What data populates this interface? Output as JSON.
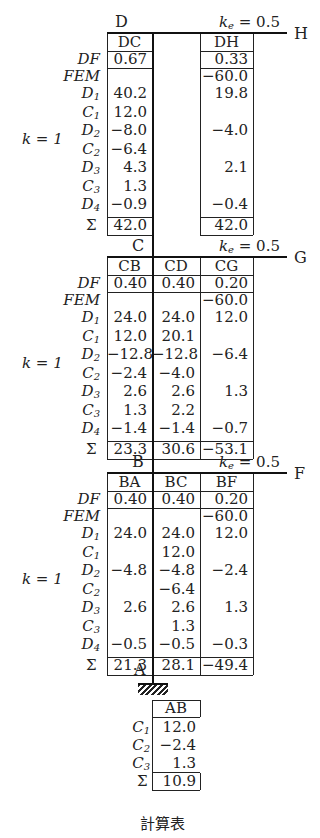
{
  "caption": "計算表",
  "row_labels": {
    "df": "DF",
    "fem": "FEM",
    "d1": "D",
    "d1_sub": "1",
    "c1": "C",
    "c1_sub": "1",
    "d2": "D",
    "d2_sub": "2",
    "c2": "C",
    "c2_sub": "2",
    "d3": "D",
    "d3_sub": "3",
    "c3": "C",
    "c3_sub": "3",
    "d4": "D",
    "d4_sub": "4",
    "sum": "Σ"
  },
  "k_label": "k = 1",
  "ke_label": "ke = 0.5",
  "nodes": {
    "D": "D",
    "H": "H",
    "C": "C",
    "G": "G",
    "B": "B",
    "F": "F",
    "A": "A"
  },
  "sections": [
    {
      "node": "D",
      "beam_end": "H",
      "columns": [
        {
          "header": "DC",
          "DF": "0.67",
          "FEM": "",
          "D1": "40.2",
          "C1": "12.0",
          "D2": "−8.0",
          "C2": "−6.4",
          "D3": "4.3",
          "C3": "1.3",
          "D4": "−0.9",
          "sum": "42.0"
        },
        {
          "header": "DH",
          "DF": "0.33",
          "FEM": "−60.0",
          "D1": "19.8",
          "C1": "",
          "D2": "−4.0",
          "C2": "",
          "D3": "2.1",
          "C3": "",
          "D4": "−0.4",
          "sum": "42.0"
        }
      ]
    },
    {
      "node": "C",
      "beam_end": "G",
      "columns": [
        {
          "header": "CB",
          "DF": "0.40",
          "FEM": "",
          "D1": "24.0",
          "C1": "12.0",
          "D2": "−12.8",
          "C2": "−2.4",
          "D3": "2.6",
          "C3": "1.3",
          "D4": "−1.4",
          "sum": "23.3"
        },
        {
          "header": "CD",
          "DF": "0.40",
          "FEM": "",
          "D1": "24.0",
          "C1": "20.1",
          "D2": "−12.8",
          "C2": "−4.0",
          "D3": "2.6",
          "C3": "2.2",
          "D4": "−1.4",
          "sum": "30.6"
        },
        {
          "header": "CG",
          "DF": "0.20",
          "FEM": "−60.0",
          "D1": "12.0",
          "C1": "",
          "D2": "−6.4",
          "C2": "",
          "D3": "1.3",
          "C3": "",
          "D4": "−0.7",
          "sum": "−53.1"
        }
      ]
    },
    {
      "node": "B",
      "beam_end": "F",
      "columns": [
        {
          "header": "BA",
          "DF": "0.40",
          "FEM": "",
          "D1": "24.0",
          "C1": "",
          "D2": "−4.8",
          "C2": "",
          "D3": "2.6",
          "C3": "",
          "D4": "−0.5",
          "sum": "21.3"
        },
        {
          "header": "BC",
          "DF": "0.40",
          "FEM": "",
          "D1": "24.0",
          "C1": "12.0",
          "D2": "−4.8",
          "C2": "−6.4",
          "D3": "2.6",
          "C3": "1.3",
          "D4": "−0.5",
          "sum": "28.1"
        },
        {
          "header": "BF",
          "DF": "0.20",
          "FEM": "−60.0",
          "D1": "12.0",
          "C1": "",
          "D2": "−2.4",
          "C2": "",
          "D3": "1.3",
          "C3": "",
          "D4": "−0.3",
          "sum": "−49.4"
        }
      ]
    }
  ],
  "support": {
    "node": "A",
    "column": {
      "header": "AB",
      "C1": "12.0",
      "C2": "−2.4",
      "C3": "1.3",
      "sum": "10.9"
    }
  }
}
